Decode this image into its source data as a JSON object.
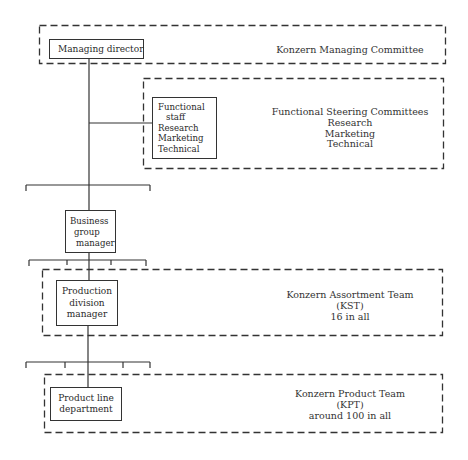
{
  "diagram": {
    "type": "organizational-chart",
    "nodes": {
      "managing_director": {
        "label": "Managing director"
      },
      "functional_staff": {
        "lines": [
          "Functional",
          "staff",
          "Research",
          "Marketing",
          "Technical"
        ]
      },
      "business_group_manager": {
        "lines": [
          "Business",
          "group",
          "manager"
        ]
      },
      "production_division_manager": {
        "lines": [
          "Production",
          "division",
          "manager"
        ]
      },
      "product_line_department": {
        "lines": [
          "Product line",
          "department"
        ]
      }
    },
    "committees": {
      "managing_committee": {
        "lines": [
          "Konzern Managing Committee"
        ]
      },
      "steering_committees": {
        "lines": [
          "Functional Steering Committees",
          "Research",
          "Marketing",
          "Technical"
        ]
      },
      "assortment_team": {
        "lines": [
          "Konzern Assortment Team",
          "(KST)",
          "16 in all"
        ]
      },
      "product_team": {
        "lines": [
          "Konzern Product Team",
          "(KPT)",
          "around 100 in all"
        ]
      }
    },
    "edges": [
      [
        "managing_director",
        "functional_staff"
      ],
      [
        "managing_director",
        "business_group_manager"
      ],
      [
        "business_group_manager",
        "production_division_manager"
      ],
      [
        "production_division_manager",
        "product_line_department"
      ]
    ]
  }
}
